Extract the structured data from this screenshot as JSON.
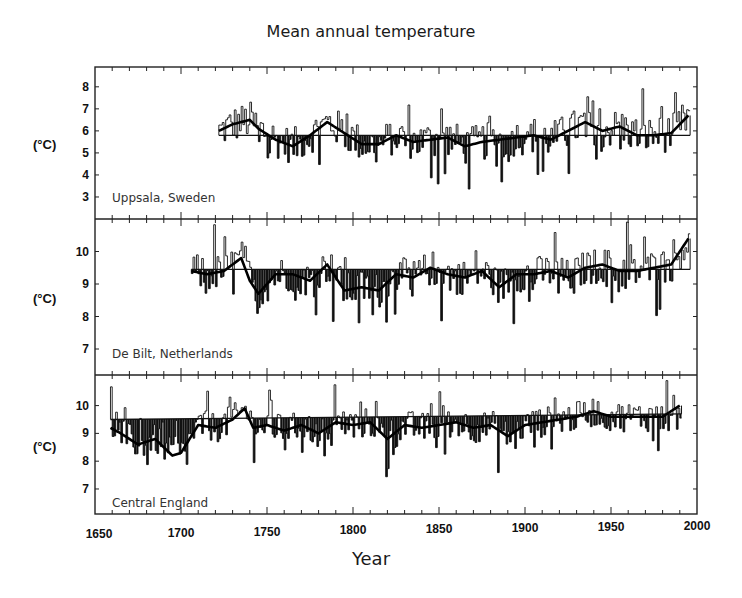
{
  "chart_data": {
    "type": "line",
    "title": "Mean annual temperature",
    "xlabel": "Year",
    "xlim": [
      1650,
      2000
    ],
    "x_ticks": [
      1650,
      1700,
      1750,
      1800,
      1850,
      1900,
      1950,
      2000
    ],
    "grid": false,
    "legend": "none",
    "panels": [
      {
        "name": "Uppsala, Sweden",
        "ylabel": "(°C)",
        "y_ticks": [
          3,
          4,
          5,
          6,
          7,
          8
        ],
        "ylim": [
          2.0,
          8.9
        ],
        "start_year": 1722,
        "end_year": 1995,
        "mean": 5.8,
        "smoothed": {
          "x": [
            1722,
            1730,
            1740,
            1745,
            1755,
            1765,
            1775,
            1785,
            1795,
            1805,
            1815,
            1825,
            1835,
            1845,
            1855,
            1865,
            1875,
            1885,
            1895,
            1905,
            1915,
            1925,
            1935,
            1945,
            1955,
            1965,
            1975,
            1985,
            1995
          ],
          "y": [
            6.0,
            6.3,
            6.5,
            6.1,
            5.6,
            5.3,
            5.8,
            6.4,
            5.9,
            5.4,
            5.4,
            5.8,
            5.5,
            5.6,
            5.7,
            5.3,
            5.5,
            5.6,
            5.7,
            5.8,
            5.6,
            6.0,
            6.4,
            6.0,
            6.2,
            5.8,
            5.8,
            5.9,
            6.7
          ]
        }
      },
      {
        "name": "De Bilt, Netherlands",
        "ylabel": "(°C)",
        "y_ticks": [
          7,
          8,
          9,
          10
        ],
        "ylim": [
          6.2,
          11.0
        ],
        "start_year": 1706,
        "end_year": 1995,
        "mean": 9.45,
        "smoothed": {
          "x": [
            1706,
            1715,
            1725,
            1735,
            1740,
            1745,
            1755,
            1765,
            1775,
            1785,
            1795,
            1805,
            1815,
            1825,
            1835,
            1845,
            1855,
            1865,
            1875,
            1885,
            1895,
            1905,
            1915,
            1925,
            1935,
            1945,
            1955,
            1965,
            1975,
            1985,
            1995
          ],
          "y": [
            9.4,
            9.3,
            9.4,
            9.8,
            9.1,
            8.7,
            9.3,
            9.3,
            9.1,
            9.6,
            8.8,
            8.9,
            8.8,
            9.3,
            9.2,
            9.5,
            9.3,
            9.2,
            9.4,
            8.9,
            9.3,
            9.3,
            9.4,
            9.2,
            9.5,
            9.6,
            9.4,
            9.4,
            9.5,
            9.6,
            10.4
          ]
        }
      },
      {
        "name": "Central England",
        "ylabel": "(°C)",
        "y_ticks": [
          7,
          8,
          9,
          10
        ],
        "ylim": [
          6.1,
          11.1
        ],
        "start_year": 1659,
        "end_year": 1990,
        "mean_line": {
          "x": [
            1659,
            1990
          ],
          "y": [
            9.5,
            9.7
          ]
        },
        "smoothed": {
          "x": [
            1659,
            1665,
            1675,
            1685,
            1695,
            1700,
            1710,
            1720,
            1730,
            1737,
            1742,
            1750,
            1760,
            1770,
            1780,
            1790,
            1800,
            1810,
            1820,
            1830,
            1840,
            1850,
            1860,
            1870,
            1880,
            1890,
            1900,
            1910,
            1920,
            1930,
            1940,
            1950,
            1960,
            1970,
            1980,
            1990
          ],
          "y": [
            9.2,
            9.0,
            8.6,
            8.8,
            8.2,
            8.3,
            9.3,
            9.2,
            9.5,
            9.9,
            9.2,
            9.3,
            9.1,
            9.3,
            9.0,
            9.4,
            9.3,
            9.4,
            8.8,
            9.3,
            9.2,
            9.3,
            9.4,
            9.2,
            9.3,
            8.9,
            9.3,
            9.4,
            9.5,
            9.6,
            9.8,
            9.6,
            9.6,
            9.6,
            9.6,
            10.0
          ]
        }
      }
    ]
  }
}
